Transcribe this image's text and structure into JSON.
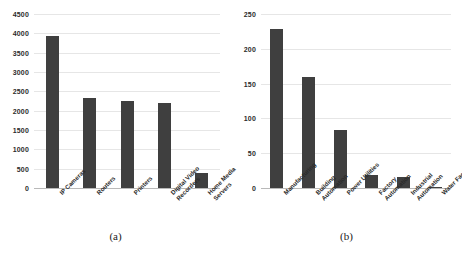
{
  "figure": {
    "background": "#ffffff",
    "bar_color": "#3f3f3f",
    "gridline_color": "#e6e6e6",
    "axis_color": "#c9c9c9"
  },
  "panels": [
    {
      "caption": "(a)",
      "chart_data": {
        "type": "bar",
        "title": "",
        "xlabel": "",
        "ylabel": "",
        "categories": [
          "IP Cameras",
          "Routers",
          "Printers",
          "Digital Video\nRecorders",
          "Home Media\nServers"
        ],
        "values": [
          3920,
          2340,
          2260,
          2210,
          390
        ],
        "yticks": [
          0,
          500,
          1000,
          1500,
          2000,
          2500,
          3000,
          3500,
          4000,
          4500
        ],
        "ylim": [
          0,
          4500
        ],
        "grid": true,
        "legend": "none"
      }
    },
    {
      "caption": "(b)",
      "chart_data": {
        "type": "bar",
        "title": "",
        "xlabel": "",
        "ylabel": "",
        "categories": [
          "Manufacturing",
          "Building\nAutomation",
          "Power Utilities",
          "Factory\nAutomation",
          "Industrial\nAutomation",
          "Water Facilities"
        ],
        "values": [
          228,
          160,
          84,
          18,
          16,
          2
        ],
        "yticks": [
          0,
          50,
          100,
          150,
          200,
          250
        ],
        "ylim": [
          0,
          250
        ],
        "grid": true,
        "legend": "none"
      }
    }
  ]
}
